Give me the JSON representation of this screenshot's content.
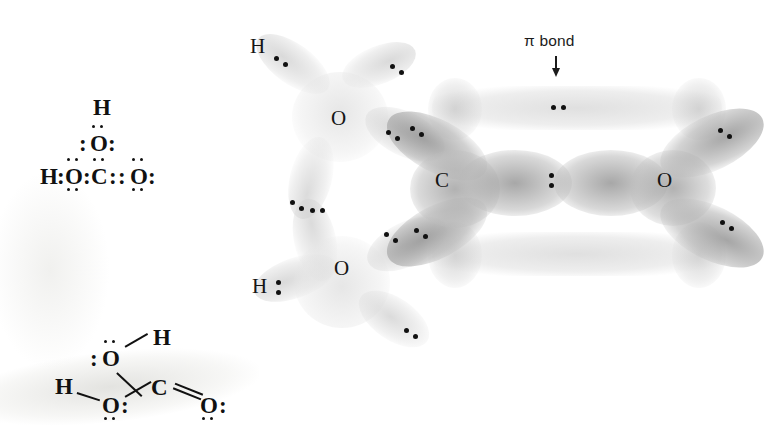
{
  "figure": {
    "background_color": "#ffffff",
    "ink_color": "#111111"
  },
  "lewis_structures": [
    {
      "name": "lewis-structure-dot",
      "description": "Electron-dot (Lewis) structure of carbonic acid drawn with colons for bonding pairs",
      "atoms": [
        {
          "symbol": "H",
          "x": 42,
          "y": 140
        },
        {
          "symbol": "O",
          "x": 96,
          "y": 130
        },
        {
          "symbol": "H",
          "x": 96,
          "y": 96
        },
        {
          "symbol": "C",
          "x": 134,
          "y": 140
        },
        {
          "symbol": "O",
          "x": 176,
          "y": 140
        }
      ]
    },
    {
      "name": "lewis-structure-line",
      "description": "Line-bond structure of carbonic acid with lone pairs",
      "atoms": [
        {
          "symbol": "H",
          "x": 60,
          "y": 378
        },
        {
          "symbol": "O",
          "x": 110,
          "y": 352
        },
        {
          "symbol": "O",
          "x": 110,
          "y": 400
        },
        {
          "symbol": "C",
          "x": 157,
          "y": 382
        },
        {
          "symbol": "O",
          "x": 205,
          "y": 400
        },
        {
          "symbol": "H",
          "x": 158,
          "y": 342
        }
      ]
    }
  ],
  "orbital_model": {
    "name": "orbital-overlap-model",
    "annotation": {
      "pi_bond_label": "π bond",
      "arrow": "down-arrow"
    },
    "atom_labels": [
      {
        "symbol": "H",
        "role": "hydrogen-upper",
        "x": 255,
        "y": 45
      },
      {
        "symbol": "O",
        "role": "oxygen-hydroxyl-upper",
        "x": 337,
        "y": 118
      },
      {
        "symbol": "C",
        "role": "carbon-central",
        "x": 441,
        "y": 180
      },
      {
        "symbol": "O",
        "role": "oxygen-carbonyl",
        "x": 663,
        "y": 180
      },
      {
        "symbol": "H",
        "role": "hydrogen-lower",
        "x": 257,
        "y": 285
      },
      {
        "symbol": "O",
        "role": "oxygen-hydroxyl-lower",
        "x": 340,
        "y": 268
      }
    ],
    "electron_pairs_visible": 14,
    "pi_electron_pair": {
      "x": 556,
      "y": 108
    }
  },
  "glyphs": {
    "colon": ":",
    "double_colon": "::"
  }
}
